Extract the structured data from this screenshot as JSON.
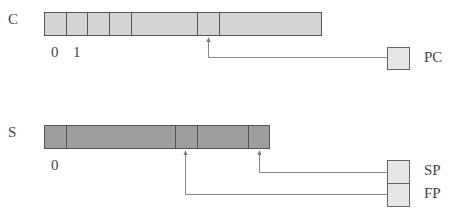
{
  "code_array": {
    "label": "C",
    "indices": [
      "0",
      "1"
    ],
    "cells": [
      {
        "x": 44,
        "w": 22
      },
      {
        "x": 66,
        "w": 21
      },
      {
        "x": 87,
        "w": 22
      },
      {
        "x": 109,
        "w": 22
      },
      {
        "x": 131,
        "w": 66
      },
      {
        "x": 197,
        "w": 22
      },
      {
        "x": 219,
        "w": 103
      }
    ]
  },
  "stack_array": {
    "label": "S",
    "indices": [
      "0"
    ],
    "cells": [
      {
        "x": 44,
        "w": 22
      },
      {
        "x": 66,
        "w": 109
      },
      {
        "x": 175,
        "w": 22
      },
      {
        "x": 197,
        "w": 51
      },
      {
        "x": 248,
        "w": 22
      }
    ]
  },
  "registers": [
    {
      "name": "PC",
      "points_to": "C cell 6"
    },
    {
      "name": "SP",
      "points_to": "S cell 5"
    },
    {
      "name": "FP",
      "points_to": "S cell 3"
    }
  ],
  "colors": {
    "code_cell": "#d4d4d4",
    "stack_cell": "#9e9e9e",
    "register": "#e6e6e6",
    "arrow": "#888888"
  }
}
